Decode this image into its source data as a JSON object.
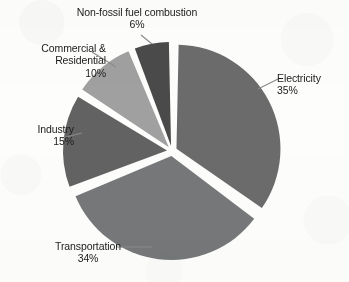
{
  "chart_data": {
    "type": "pie",
    "title": "",
    "subtitle": "",
    "xlabel": "",
    "ylabel": "",
    "legend_position": "none",
    "grid": false,
    "units": "percent",
    "categories": [
      "Electricity",
      "Transportation",
      "Industry",
      "Commercial & Residential",
      "Non-fossil fuel combustion"
    ],
    "values": [
      35,
      34,
      15,
      10,
      6
    ],
    "slices": [
      {
        "name": "Electricity",
        "label_line_1": "Electricity",
        "label_line_2": "",
        "value": 35,
        "value_text": "35%",
        "color": "#6b6b6b",
        "start_angle_deg": 0,
        "end_angle_deg": 126,
        "exploded": true
      },
      {
        "name": "Transportation",
        "label_line_1": "Transportation",
        "label_line_2": "",
        "value": 34,
        "value_text": "34%",
        "color": "#757779",
        "start_angle_deg": 126,
        "end_angle_deg": 248.4,
        "exploded": true
      },
      {
        "name": "Industry",
        "label_line_1": "Industry",
        "label_line_2": "",
        "value": 15,
        "value_text": "15%",
        "color": "#626262",
        "start_angle_deg": 248.4,
        "end_angle_deg": 302.4,
        "exploded": true
      },
      {
        "name": "Commercial & Residential",
        "label_line_1": "Commercial &",
        "label_line_2": "Residential",
        "value": 10,
        "value_text": "10%",
        "color": "#a0a0a0",
        "start_angle_deg": 302.4,
        "end_angle_deg": 338.4,
        "exploded": true
      },
      {
        "name": "Non-fossil fuel combustion",
        "label_line_1": "Non-fossil fuel combustion",
        "label_line_2": "",
        "value": 6,
        "value_text": "6%",
        "color": "#4a4a4a",
        "start_angle_deg": 338.4,
        "end_angle_deg": 360,
        "exploded": true
      }
    ],
    "background_color": "#fdfdfc",
    "label_color": "#1b1b1b",
    "leader_line_color": "#8a8a8a"
  },
  "labels": {
    "nonfossil": {
      "line1": "Non-fossil fuel combustion",
      "line2": "6%"
    },
    "commercial": {
      "line1": "Commercial &",
      "line2": "Residential",
      "line3": "10%"
    },
    "industry": {
      "line1": "Industry",
      "line2": "15%"
    },
    "electricity": {
      "line1": "Electricity",
      "line2": "35%"
    },
    "transportation": {
      "line1": "Transportation",
      "line2": "34%"
    }
  }
}
